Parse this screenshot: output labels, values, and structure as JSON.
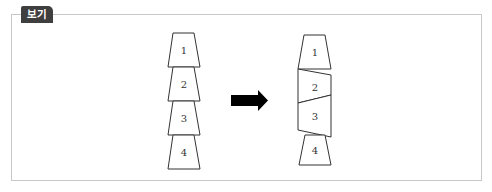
{
  "badge": {
    "label": "보기"
  },
  "diagram": {
    "before": {
      "description": "Four stacked trapezoid blocks, labeled top to bottom",
      "blocks": [
        {
          "label": "1"
        },
        {
          "label": "2"
        },
        {
          "label": "3"
        },
        {
          "label": "4"
        }
      ]
    },
    "arrow": {
      "direction": "right",
      "color": "#000000"
    },
    "after": {
      "description": "Blocks 2 and 3 deformed into a twisted prism between blocks 1 and 4",
      "blocks": [
        {
          "label": "1"
        },
        {
          "label": "2"
        },
        {
          "label": "3"
        },
        {
          "label": "4"
        }
      ]
    }
  }
}
